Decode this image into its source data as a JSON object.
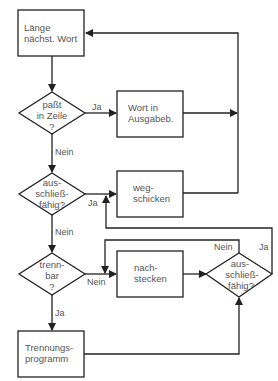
{
  "diagram": {
    "type": "flowchart",
    "nodes": {
      "n1": {
        "kind": "process",
        "line1": "Länge",
        "line2": "nächst. Wort"
      },
      "d1": {
        "kind": "decision",
        "line1": "paßt",
        "line2": "in Zeile",
        "line3": "?"
      },
      "n2": {
        "kind": "process",
        "line1": "Wort in",
        "line2": "Ausgabeb."
      },
      "d2": {
        "kind": "decision",
        "line1": "aus-",
        "line2": "schließ-",
        "line3": "fähig?"
      },
      "n3": {
        "kind": "process",
        "line1": "weg-",
        "line2": "schicken"
      },
      "d3": {
        "kind": "decision",
        "line1": "trenn-",
        "line2": "bar",
        "line3": "?"
      },
      "n4": {
        "kind": "process",
        "line1": "nach-",
        "line2": "stecken"
      },
      "d4": {
        "kind": "decision",
        "line1": "aus-",
        "line2": "schließ-",
        "line3": "fähig?"
      },
      "n5": {
        "kind": "process",
        "line1": "Trennungs-",
        "line2": "programm"
      }
    },
    "edge_labels": {
      "d1_yes": "Ja",
      "d1_no": "Nein",
      "d2_yes": "Ja",
      "d2_no": "Nein",
      "d3_no": "Nein",
      "d3_yes": "Ja",
      "d4_no": "Nein",
      "d4_yes": "Ja"
    },
    "edges": [
      {
        "from": "n1",
        "to": "d1"
      },
      {
        "from": "d1",
        "to": "n2",
        "label": "Ja"
      },
      {
        "from": "d1",
        "to": "d2",
        "label": "Nein"
      },
      {
        "from": "n2",
        "to": "n1"
      },
      {
        "from": "d2",
        "to": "n3",
        "label": "Ja"
      },
      {
        "from": "d2",
        "to": "d3",
        "label": "Nein"
      },
      {
        "from": "n3",
        "to": "n1"
      },
      {
        "from": "d3",
        "to": "n4",
        "label": "Nein"
      },
      {
        "from": "d3",
        "to": "n5",
        "label": "Ja"
      },
      {
        "from": "n4",
        "to": "d4"
      },
      {
        "from": "n5",
        "to": "d4"
      },
      {
        "from": "d4",
        "to": "n4",
        "label": "Nein"
      },
      {
        "from": "d4",
        "to": "n3",
        "label": "Ja"
      }
    ]
  }
}
